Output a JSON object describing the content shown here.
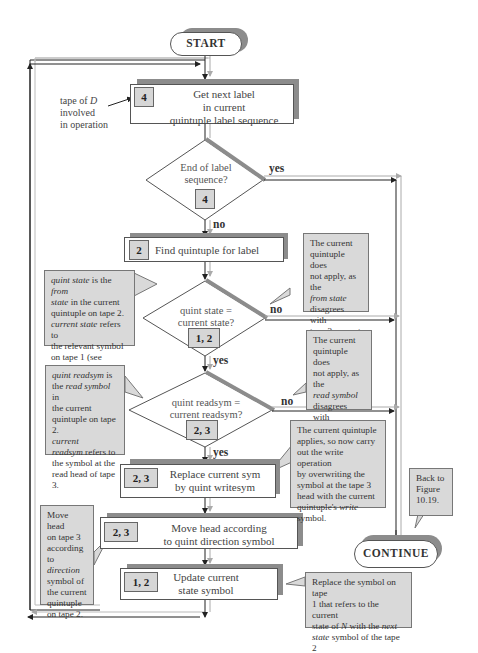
{
  "start": {
    "label": "START"
  },
  "continue": {
    "label": "CONTINUE"
  },
  "annotation_tape": {
    "line1": "tape of ",
    "tape_var": "D",
    "line2": "involved",
    "line3": "in operation"
  },
  "get_next_label": {
    "tag": "4",
    "line1": "Get next label",
    "line2": "in current",
    "line3": "quintuple label sequence"
  },
  "end_of_sequence": {
    "line1": "End of label",
    "line2": "sequence?",
    "tag": "4",
    "yes_label": "yes",
    "no_label": "no"
  },
  "find_quintuple": {
    "tag": "2",
    "text": "Find quintuple for label"
  },
  "quint_state_decision": {
    "line1": "quint state =",
    "line2": "current state?",
    "tag": "1, 2",
    "yes_label": "yes",
    "no_label": "no"
  },
  "quint_readsym_decision": {
    "line1": "quint readsym =",
    "line2": "current readsym?",
    "tag": "2, 3",
    "yes_label": "yes",
    "no_label": "no"
  },
  "replace_sym": {
    "tag": "2, 3",
    "line1": "Replace current sym",
    "line2": "by  quint writesym"
  },
  "move_head": {
    "tag": "2, 3",
    "line1": "Move head according",
    "line2": "to quint direction symbol"
  },
  "update_state": {
    "tag": "1, 2",
    "line1": "Update current",
    "line2": "state symbol"
  },
  "callouts": {
    "quint_state_note": {
      "parts": [
        {
          "t": "quint state",
          "i": true
        },
        {
          "t": " is the ",
          "i": false
        },
        {
          "t": "from",
          "i": true
        },
        {
          "t": "\nstate",
          "i": true
        },
        {
          "t": " in the current\nquintuple on tape 2.\n",
          "i": false
        },
        {
          "t": "current state",
          "i": true
        },
        {
          "t": " refers to\nthe relevant symbol\non tape 1 (see Figure\n10.7).",
          "i": false
        }
      ]
    },
    "state_mismatch_note": {
      "parts": [
        {
          "t": "The current\nquintuple does\nnot apply, as the\n",
          "i": false
        },
        {
          "t": "from state",
          "i": true
        },
        {
          "t": "\ndisagrees with\ntape 3 current\nstate.",
          "i": false
        }
      ]
    },
    "quint_readsym_note": {
      "parts": [
        {
          "t": "quint readsym",
          "i": true
        },
        {
          "t": "  is\nthe ",
          "i": false
        },
        {
          "t": "read symbol",
          "i": true
        },
        {
          "t": " in\nthe current\nquintuple on tape 2.\n",
          "i": false
        },
        {
          "t": "current\nreadsym",
          "i": true
        },
        {
          "t": " refers to\nthe symbol at the\nread head of tape 3.",
          "i": false
        }
      ]
    },
    "readsym_mismatch_note": {
      "parts": [
        {
          "t": "The current\nquintuple does\nnot apply, as the\n",
          "i": false
        },
        {
          "t": "read symbol",
          "i": true
        },
        {
          "t": "\ndisagrees with\ntape 3 read\nsymbol.",
          "i": false
        }
      ]
    },
    "write_note": {
      "parts": [
        {
          "t": "The current quintuple\napplies, so now carry\nout the write operation\nby overwriting the\nsymbol at the tape 3\nhead with the current\nquintuple's ",
          "i": false
        },
        {
          "t": "write",
          "i": true
        },
        {
          "t": "\nsymbol.",
          "i": false
        }
      ]
    },
    "back_note": {
      "parts": [
        {
          "t": "Back to\nFigure\n10.19.",
          "i": false
        }
      ]
    },
    "move_head_note": {
      "parts": [
        {
          "t": "Move head\non tape 3\naccording\nto\n",
          "i": false
        },
        {
          "t": "direction",
          "i": true
        },
        {
          "t": "\nsymbol of\nthe current\nquintuple\non tape 2.",
          "i": false
        }
      ]
    },
    "update_state_note": {
      "parts": [
        {
          "t": "Replace the symbol on tape\n1 that refers to the current\nstate of ",
          "i": false
        },
        {
          "t": "N",
          "i": true
        },
        {
          "t": " with the ",
          "i": false
        },
        {
          "t": "next\nstate",
          "i": true
        },
        {
          "t": " symbol of the tape 2\ncurrent quintuple.",
          "i": false
        }
      ]
    }
  },
  "colors": {
    "shadow": "#8c8c8c",
    "tag_fill": "#d6d6d6",
    "callout_fill": "#d9d9d9",
    "line_dark": "#222222",
    "line_light": "#b0b0b0"
  }
}
